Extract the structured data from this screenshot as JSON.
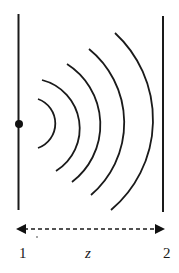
{
  "diagram": {
    "type": "wave-propagation",
    "planes": [
      {
        "id": "plane-1",
        "label": "1",
        "x": 18
      },
      {
        "id": "plane-2",
        "label": "2",
        "x": 163
      }
    ],
    "source": {
      "x": 19,
      "y": 124
    },
    "wavefront_count": 5,
    "distance_label": "z",
    "colors": {
      "stroke": "#1a1a1a",
      "background": "#ffffff"
    }
  }
}
